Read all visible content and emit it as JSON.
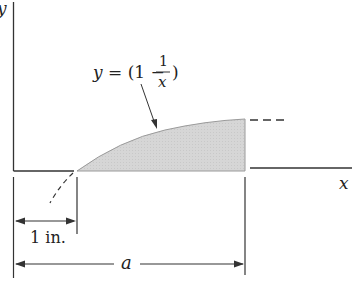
{
  "diagram": {
    "axes": {
      "y_label": "y",
      "x_label": "x"
    },
    "curve": {
      "equation_prefix": "y = (1 −",
      "fraction_numerator": "1",
      "fraction_denominator": "x",
      "equation_suffix": ")"
    },
    "dimensions": {
      "unit_length_label": "1 in.",
      "span_label": "a"
    },
    "colors": {
      "fill": "#d9d9d9",
      "stroke": "#333333"
    }
  }
}
